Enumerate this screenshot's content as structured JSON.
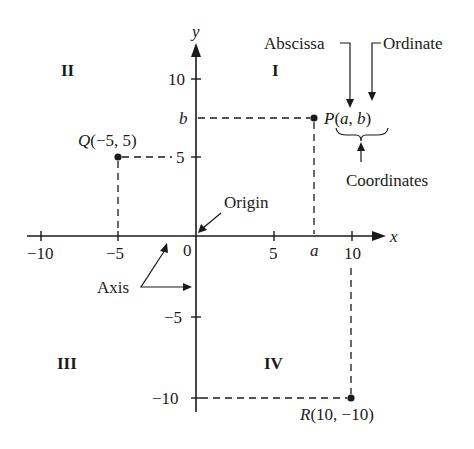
{
  "diagram": {
    "colors": {
      "ink": "#1a1a1a",
      "background": "#ffffff"
    },
    "axes": {
      "x_label": "x",
      "y_label": "y",
      "origin_label": "0",
      "x_ticks": [
        {
          "value": -10,
          "label": "−10"
        },
        {
          "value": -5,
          "label": "−5"
        },
        {
          "value": 5,
          "label": "5"
        },
        {
          "value": 10,
          "label": "10"
        }
      ],
      "y_ticks": [
        {
          "value": 10,
          "label": "10"
        },
        {
          "value": 5,
          "label": "5"
        },
        {
          "value": -5,
          "label": "−5"
        },
        {
          "value": -10,
          "label": "−10"
        }
      ],
      "x_symbol_tick": "a",
      "y_symbol_tick": "b"
    },
    "quadrants": {
      "I": "I",
      "II": "II",
      "III": "III",
      "IV": "IV"
    },
    "points": {
      "P": {
        "name": "P",
        "coords_text": "(a, b)",
        "label": "P(a, b)"
      },
      "Q": {
        "name": "Q",
        "coords_text": "(−5, 5)",
        "label": "Q(−5, 5)",
        "x": -5,
        "y": 5
      },
      "R": {
        "name": "R",
        "coords_text": "(10, −10)",
        "label": "R(10, −10)",
        "x": 10,
        "y": -10
      }
    },
    "annotations": {
      "abscissa": "Abscissa",
      "ordinate": "Ordinate",
      "coordinates": "Coordinates",
      "origin": "Origin",
      "axis": "Axis"
    }
  }
}
